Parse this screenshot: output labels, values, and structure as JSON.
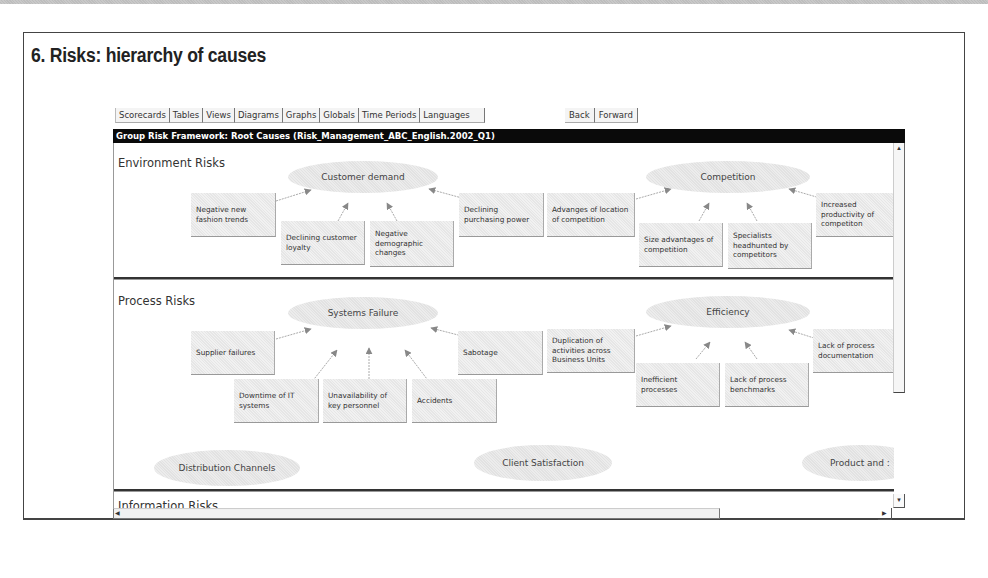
{
  "page": {
    "title": "6. Risks: hierarchy of causes"
  },
  "toolbar": {
    "tabs": [
      "Scorecards",
      "Tables",
      "Views",
      "Diagrams",
      "Graphs",
      "Globals",
      "Time Periods",
      "Languages"
    ],
    "back_label": "Back",
    "forward_label": "Forward"
  },
  "header": {
    "title": "Group Risk Framework: Root Causes (Risk_Management_ABC_English.2002_Q1)"
  },
  "sections": [
    {
      "label": "Environment Risks",
      "groups": [
        {
          "root": "Customer demand",
          "causes": [
            "Negative new fashion trends",
            "Declining customer loyalty",
            "Negative demographic changes",
            "Declining purchasing power"
          ]
        },
        {
          "root": "Competition",
          "causes": [
            "Advanges of location of competition",
            "Size advantages of competition",
            "Specialists headhunted by competitors",
            "Increased productivity of competiton"
          ]
        }
      ]
    },
    {
      "label": "Process Risks",
      "groups": [
        {
          "root": "Systems Failure",
          "causes": [
            "Supplier failures",
            "Downtime of IT systems",
            "Unavailability of key personnel",
            "Accidents",
            "Sabotage"
          ]
        },
        {
          "root": "Efficiency",
          "causes": [
            "Duplication of activities across Business Units",
            "Inefficient processes",
            "Lack of process benchmarks",
            "Lack of process documentation"
          ]
        }
      ],
      "other_roots": [
        "Distribution Channels",
        "Client Satisfaction",
        "Product and :"
      ]
    },
    {
      "label": "Information Risks"
    }
  ],
  "scrollbars": {
    "up_icon": "▲",
    "down_icon": "▼",
    "left_icon": "◀",
    "right_icon": "▶"
  }
}
